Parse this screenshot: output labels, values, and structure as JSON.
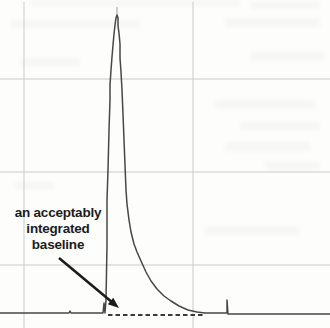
{
  "window": {
    "width_px": 330,
    "height_px": 328
  },
  "colors": {
    "background": "#fdfdfc",
    "grid": "#cbcbcb",
    "trace": "#474747",
    "baseline_dash": "#3a3a3a",
    "apex_tip": "#b4b4b4",
    "annotation_text": "#1c1c1c",
    "arrow": "#1c1c1c"
  },
  "chart_data": {
    "type": "line",
    "title": "",
    "xlabel": "",
    "ylabel": "",
    "legend": "none",
    "grid_visible": true,
    "axis_tick_labels_visible": false,
    "description_of_content": "chromatogram with single tall peak, dashed integration baseline under the peak tail, small late spike, annotation arrow to baseline",
    "grid_lines_px": {
      "vertical_x": [
        24,
        193
      ],
      "horizontal_y": [
        79,
        172,
        265
      ]
    },
    "annotation": {
      "text": "an acceptably integrated baseline",
      "lines": [
        "an acceptably",
        "integrated",
        "baseline"
      ]
    },
    "arrow_px": {
      "from": [
        59,
        258
      ],
      "to": [
        119,
        308
      ]
    },
    "trace_px": [
      [
        0,
        313
      ],
      [
        68,
        313
      ],
      [
        69,
        313
      ],
      [
        70,
        311
      ],
      [
        71,
        313
      ],
      [
        103,
        313
      ],
      [
        104,
        303
      ],
      [
        105,
        313
      ],
      [
        106,
        300
      ],
      [
        107,
        245
      ],
      [
        107,
        200
      ],
      [
        108,
        170
      ],
      [
        109,
        130
      ],
      [
        110,
        100
      ],
      [
        110,
        85
      ],
      [
        111,
        70
      ],
      [
        112,
        57
      ],
      [
        113,
        45
      ],
      [
        114,
        34
      ],
      [
        115,
        25
      ],
      [
        116,
        18
      ],
      [
        117,
        15
      ],
      [
        118,
        18
      ],
      [
        118,
        26
      ],
      [
        119,
        33
      ],
      [
        120,
        44
      ],
      [
        120,
        58
      ],
      [
        121,
        72
      ],
      [
        122,
        90
      ],
      [
        123,
        114
      ],
      [
        124,
        140
      ],
      [
        125,
        165
      ],
      [
        126,
        190
      ],
      [
        127,
        204
      ],
      [
        129,
        220
      ],
      [
        131,
        232
      ],
      [
        134,
        244
      ],
      [
        137,
        252
      ],
      [
        141,
        261
      ],
      [
        146,
        272
      ],
      [
        151,
        281
      ],
      [
        157,
        289
      ],
      [
        164,
        296
      ],
      [
        171,
        301
      ],
      [
        179,
        306
      ],
      [
        188,
        310
      ],
      [
        197,
        312
      ],
      [
        205,
        313
      ],
      [
        226,
        313
      ],
      [
        227,
        313
      ],
      [
        227,
        300
      ],
      [
        228,
        314
      ],
      [
        330,
        314
      ]
    ],
    "apex_tip_px": [
      [
        117,
        18
      ],
      [
        117,
        7
      ]
    ],
    "baseline_dash_px": {
      "from": [
        108,
        315
      ],
      "to": [
        204,
        315
      ],
      "dash": [
        4.5,
        3
      ]
    }
  }
}
